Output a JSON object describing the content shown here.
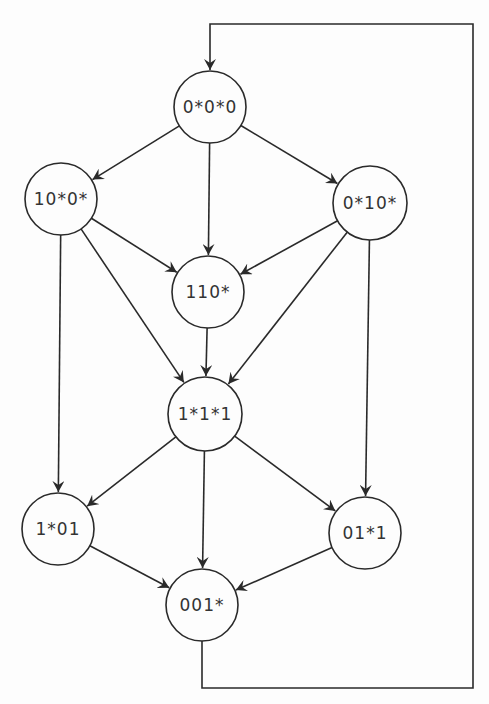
{
  "diagram": {
    "type": "state-transition-graph",
    "nodes": [
      {
        "id": "n0",
        "label": "0*0*0",
        "x": 210,
        "y": 107,
        "r": 36
      },
      {
        "id": "n1",
        "label": "10*0*",
        "x": 61,
        "y": 199,
        "r": 36
      },
      {
        "id": "n2",
        "label": "0*10*",
        "x": 370,
        "y": 203,
        "r": 37
      },
      {
        "id": "n3",
        "label": "110*",
        "x": 208,
        "y": 292,
        "r": 36
      },
      {
        "id": "n4",
        "label": "1*1*1",
        "x": 205,
        "y": 414,
        "r": 37
      },
      {
        "id": "n5",
        "label": "1*01",
        "x": 58,
        "y": 529,
        "r": 36
      },
      {
        "id": "n6",
        "label": "01*1",
        "x": 365,
        "y": 533,
        "r": 36
      },
      {
        "id": "n7",
        "label": "001*",
        "x": 202,
        "y": 605,
        "r": 36
      }
    ],
    "edges": [
      {
        "from": "0*0*0",
        "to": "10*0*"
      },
      {
        "from": "0*0*0",
        "to": "110*"
      },
      {
        "from": "0*0*0",
        "to": "0*10*"
      },
      {
        "from": "10*0*",
        "to": "110*"
      },
      {
        "from": "10*0*",
        "to": "1*1*1"
      },
      {
        "from": "10*0*",
        "to": "1*01"
      },
      {
        "from": "0*10*",
        "to": "110*"
      },
      {
        "from": "0*10*",
        "to": "1*1*1"
      },
      {
        "from": "0*10*",
        "to": "01*1"
      },
      {
        "from": "110*",
        "to": "1*1*1"
      },
      {
        "from": "1*1*1",
        "to": "1*01"
      },
      {
        "from": "1*1*1",
        "to": "001*"
      },
      {
        "from": "1*1*1",
        "to": "01*1"
      },
      {
        "from": "1*01",
        "to": "001*"
      },
      {
        "from": "01*1",
        "to": "001*"
      },
      {
        "from": "001*",
        "to": "0*0*0",
        "routing": "feedback-loop-right"
      }
    ]
  }
}
